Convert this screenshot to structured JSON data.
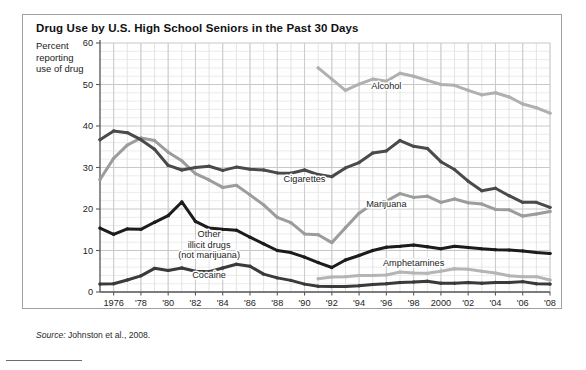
{
  "figure": {
    "title": "Drug Use by U.S. High School Seniors in the Past 30 Days",
    "y_axis_caption_line1": "Percent",
    "y_axis_caption_line2": "reporting",
    "y_axis_caption_line3": "use of drug",
    "source_prefix": "Source:",
    "source_text": " Johnston et al., 2008."
  },
  "chart_data": {
    "type": "line",
    "title": "Drug Use by U.S. High School Seniors in the Past 30 Days",
    "xlabel": "Year",
    "ylabel": "Percent reporting use of drug",
    "xlim": [
      1975,
      2008
    ],
    "ylim": [
      0,
      60
    ],
    "yticks": [
      0,
      10,
      20,
      30,
      40,
      50,
      60
    ],
    "ytick_labels": [
      "0",
      "10",
      "20",
      "30",
      "40",
      "50",
      "60"
    ],
    "xticks": [
      1976,
      1978,
      1980,
      1982,
      1984,
      1986,
      1988,
      1990,
      1992,
      1994,
      1996,
      1998,
      2000,
      2002,
      2004,
      2006,
      2008
    ],
    "xtick_labels": [
      "1976",
      "'78",
      "'80",
      "'82",
      "'84",
      "'86",
      "'88",
      "'90",
      "'92",
      "'94",
      "'96",
      "'98",
      "2000",
      "'02",
      "'04",
      "'06",
      "'08"
    ],
    "grid": true,
    "grid_minor_y_step": 2,
    "grid_minor_x_step": 1,
    "legend": "inline-labels",
    "x": [
      1975,
      1976,
      1977,
      1978,
      1979,
      1980,
      1981,
      1982,
      1983,
      1984,
      1985,
      1986,
      1987,
      1988,
      1989,
      1990,
      1991,
      1992,
      1993,
      1994,
      1995,
      1996,
      1997,
      1998,
      1999,
      2000,
      2001,
      2002,
      2003,
      2004,
      2005,
      2006,
      2007,
      2008
    ],
    "series": [
      {
        "name": "Alcohol",
        "color": "#b0b0b0",
        "label_x": 1996,
        "label_y": 49,
        "x": [
          1991,
          1992,
          1993,
          1994,
          1995,
          1996,
          1997,
          1998,
          1999,
          2000,
          2001,
          2002,
          2003,
          2004,
          2005,
          2006,
          2007,
          2008
        ],
        "values": [
          54.0,
          51.3,
          48.6,
          50.1,
          51.3,
          50.8,
          52.7,
          52.0,
          51.0,
          50.0,
          49.8,
          48.6,
          47.5,
          48.0,
          47.0,
          45.3,
          44.4,
          43.1
        ]
      },
      {
        "name": "Cigarettes",
        "color": "#4a4a4a",
        "label_x": 1990,
        "label_y": 26.5,
        "x": [
          1975,
          1976,
          1977,
          1978,
          1979,
          1980,
          1981,
          1982,
          1983,
          1984,
          1985,
          1986,
          1987,
          1988,
          1989,
          1990,
          1991,
          1992,
          1993,
          1994,
          1995,
          1996,
          1997,
          1998,
          1999,
          2000,
          2001,
          2002,
          2003,
          2004,
          2005,
          2006,
          2007,
          2008
        ],
        "values": [
          36.7,
          38.8,
          38.4,
          36.7,
          34.4,
          30.5,
          29.4,
          30.0,
          30.3,
          29.3,
          30.1,
          29.6,
          29.4,
          28.7,
          28.6,
          29.4,
          28.3,
          27.8,
          29.9,
          31.2,
          33.5,
          34.0,
          36.5,
          35.1,
          34.6,
          31.4,
          29.5,
          26.7,
          24.4,
          25.0,
          23.2,
          21.6,
          21.6,
          20.4
        ]
      },
      {
        "name": "Marijuana",
        "color": "#9c9c9c",
        "label_x": 1996,
        "label_y": 20.5,
        "x": [
          1975,
          1976,
          1977,
          1978,
          1979,
          1980,
          1981,
          1982,
          1983,
          1984,
          1985,
          1986,
          1987,
          1988,
          1989,
          1990,
          1991,
          1992,
          1993,
          1994,
          1995,
          1996,
          1997,
          1998,
          1999,
          2000,
          2001,
          2002,
          2003,
          2004,
          2005,
          2006,
          2007,
          2008
        ],
        "values": [
          27.1,
          32.2,
          35.4,
          37.1,
          36.5,
          33.7,
          31.6,
          28.5,
          27.0,
          25.2,
          25.7,
          23.4,
          21.0,
          18.0,
          16.7,
          14.0,
          13.8,
          11.9,
          15.5,
          19.0,
          21.2,
          21.9,
          23.7,
          22.8,
          23.1,
          21.6,
          22.4,
          21.5,
          21.2,
          19.9,
          19.8,
          18.3,
          18.8,
          19.4
        ]
      },
      {
        "name": "Other illicit drugs (not marijuana)",
        "color": "#1c1c1c",
        "label_x": 1983,
        "label_y": 13.2,
        "x": [
          1975,
          1976,
          1977,
          1978,
          1979,
          1980,
          1981,
          1982,
          1983,
          1984,
          1985,
          1986,
          1987,
          1988,
          1989,
          1990,
          1991,
          1992,
          1993,
          1994,
          1995,
          1996,
          1997,
          1998,
          1999,
          2000,
          2001,
          2002,
          2003,
          2004,
          2005,
          2006,
          2007,
          2008
        ],
        "values": [
          15.4,
          13.9,
          15.2,
          15.1,
          16.8,
          18.4,
          21.7,
          17.0,
          15.4,
          15.1,
          14.9,
          13.2,
          11.6,
          10.0,
          9.5,
          8.4,
          7.1,
          5.9,
          7.7,
          8.8,
          10.0,
          10.8,
          11.0,
          11.3,
          10.9,
          10.4,
          11.0,
          10.7,
          10.4,
          10.2,
          10.1,
          9.9,
          9.5,
          9.3
        ]
      },
      {
        "name": "Cocaine",
        "color": "#3a3a3a",
        "label_x": 1983,
        "label_y": 3.3,
        "x": [
          1975,
          1976,
          1977,
          1978,
          1979,
          1980,
          1981,
          1982,
          1983,
          1984,
          1985,
          1986,
          1987,
          1988,
          1989,
          1990,
          1991,
          1992,
          1993,
          1994,
          1995,
          1996,
          1997,
          1998,
          1999,
          2000,
          2001,
          2002,
          2003,
          2004,
          2005,
          2006,
          2007,
          2008
        ],
        "values": [
          1.9,
          2.0,
          2.9,
          3.9,
          5.7,
          5.2,
          5.8,
          5.0,
          4.9,
          5.8,
          6.7,
          6.2,
          4.3,
          3.4,
          2.8,
          1.9,
          1.4,
          1.3,
          1.3,
          1.5,
          1.8,
          2.0,
          2.3,
          2.4,
          2.6,
          2.1,
          2.1,
          2.3,
          2.1,
          2.3,
          2.3,
          2.5,
          2.0,
          1.9
        ]
      },
      {
        "name": "Amphetamines",
        "color": "#b5b5b5",
        "label_x": 1998,
        "label_y": 6.2,
        "x": [
          1991,
          1992,
          1993,
          1994,
          1995,
          1996,
          1997,
          1998,
          1999,
          2000,
          2001,
          2002,
          2003,
          2004,
          2005,
          2006,
          2007,
          2008
        ],
        "values": [
          3.2,
          3.6,
          3.7,
          4.0,
          4.0,
          4.1,
          4.8,
          4.6,
          4.5,
          5.0,
          5.6,
          5.5,
          5.0,
          4.6,
          3.9,
          3.7,
          3.7,
          2.9
        ]
      }
    ]
  }
}
